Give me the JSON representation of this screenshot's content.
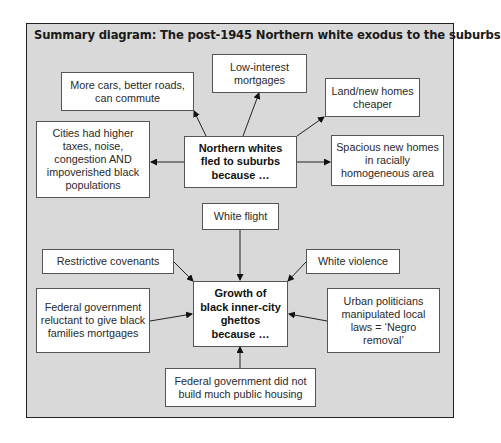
{
  "diagram": {
    "title": "Summary diagram: The post-1945 Northern white exodus to the suburbs",
    "top_section": {
      "central": "Northern whites fled to suburbs because …",
      "causes": [
        {
          "id": "cars",
          "label": "More cars, better roads, can commute"
        },
        {
          "id": "mortgages",
          "label": "Low-interest mortgages"
        },
        {
          "id": "land",
          "label": "Land/new homes cheaper"
        },
        {
          "id": "cities",
          "label": "Cities had higher taxes, noise, congestion AND impoverished black populations"
        },
        {
          "id": "spacious",
          "label": "Spacious new homes in racially homogeneous area"
        }
      ]
    },
    "bottom_section": {
      "central": "Growth of black inner-city ghettos because …",
      "causes": [
        {
          "id": "white-flight",
          "label": "White flight"
        },
        {
          "id": "covenants",
          "label": "Restrictive covenants"
        },
        {
          "id": "violence",
          "label": "White violence"
        },
        {
          "id": "fed-mortgages",
          "label": "Federal government reluctant to give black families mortgages"
        },
        {
          "id": "urban-politicians",
          "label": "Urban politicians manipulated local laws = ‘Negro removal’"
        },
        {
          "id": "public-housing",
          "label": "Federal government did not build much public housing"
        }
      ]
    },
    "colors": {
      "background": "#d9d9d9",
      "box_fill": "#ffffff",
      "border": "#222222"
    }
  }
}
